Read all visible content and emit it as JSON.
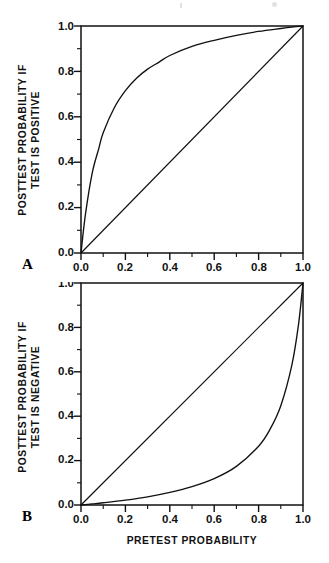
{
  "figure": {
    "background": "#ffffff",
    "ink": "#111111",
    "xlabel": "PRETEST PROBABILITY"
  },
  "chart_data": [
    {
      "type": "line",
      "panel_label": "A",
      "title": "",
      "xlabel": "",
      "ylabel": "POSTTEST PROBABILITY IF TEST IS POSITIVE",
      "ylabel_lines": [
        "POSTTEST PROBABILITY IF",
        "TEST IS POSITIVE"
      ],
      "xlim": [
        0.0,
        1.0
      ],
      "ylim": [
        0.0,
        1.0
      ],
      "xticks": [
        0.0,
        0.2,
        0.4,
        0.6,
        0.8,
        1.0
      ],
      "xticklabels": [
        "0.0",
        "0.2",
        "0.4",
        "0.6",
        "0.8",
        "1.0"
      ],
      "yticks": [
        0.0,
        0.2,
        0.4,
        0.6,
        0.8,
        1.0
      ],
      "yticklabels": [
        "0.0",
        "0.2",
        "0.4",
        "0.6",
        "0.8",
        "1.0"
      ],
      "minor_tick_step": 0.1,
      "grid": false,
      "legend": null,
      "series": [
        {
          "name": "posttest probability if test is positive",
          "note": "Bayes posterior with positive likelihood ratio about 10",
          "x": [
            0.0,
            0.02,
            0.05,
            0.08,
            0.1,
            0.15,
            0.2,
            0.25,
            0.3,
            0.35,
            0.4,
            0.5,
            0.6,
            0.7,
            0.8,
            0.9,
            0.95,
            1.0
          ],
          "y": [
            0.0,
            0.17,
            0.35,
            0.46,
            0.53,
            0.64,
            0.715,
            0.77,
            0.81,
            0.84,
            0.87,
            0.91,
            0.937,
            0.959,
            0.976,
            0.989,
            0.995,
            1.0
          ]
        },
        {
          "name": "reference line of identity",
          "x": [
            0.0,
            1.0
          ],
          "y": [
            0.0,
            1.0
          ]
        }
      ]
    },
    {
      "type": "line",
      "panel_label": "B",
      "title": "",
      "xlabel": "PRETEST PROBABILITY",
      "ylabel": "POSTTEST PROBABILITY IF TEST IS NEGATIVE",
      "ylabel_lines": [
        "POSTTEST PROBABILITY IF",
        "TEST IS NEGATIVE"
      ],
      "xlim": [
        0.0,
        1.0
      ],
      "ylim": [
        0.0,
        1.0
      ],
      "xticks": [
        0.0,
        0.2,
        0.4,
        0.6,
        0.8,
        1.0
      ],
      "xticklabels": [
        "0.0",
        "0.2",
        "0.4",
        "0.6",
        "0.8",
        "1.0"
      ],
      "yticks": [
        0.0,
        0.2,
        0.4,
        0.6,
        0.8,
        1.0
      ],
      "yticklabels": [
        "0.0",
        "0.2",
        "0.4",
        "0.6",
        "0.8",
        "1.0"
      ],
      "minor_tick_step": 0.1,
      "grid": false,
      "legend": null,
      "series": [
        {
          "name": "posttest probability if test is negative",
          "note": "Bayes posterior with negative likelihood ratio about 0.09",
          "x": [
            0.0,
            0.05,
            0.1,
            0.2,
            0.3,
            0.4,
            0.5,
            0.6,
            0.7,
            0.8,
            0.85,
            0.9,
            0.95,
            0.98,
            1.0
          ],
          "y": [
            0.0,
            0.005,
            0.01,
            0.022,
            0.037,
            0.057,
            0.083,
            0.119,
            0.174,
            0.265,
            0.338,
            0.447,
            0.631,
            0.815,
            1.0
          ]
        },
        {
          "name": "reference line of identity",
          "x": [
            0.0,
            1.0
          ],
          "y": [
            0.0,
            1.0
          ]
        }
      ]
    }
  ]
}
